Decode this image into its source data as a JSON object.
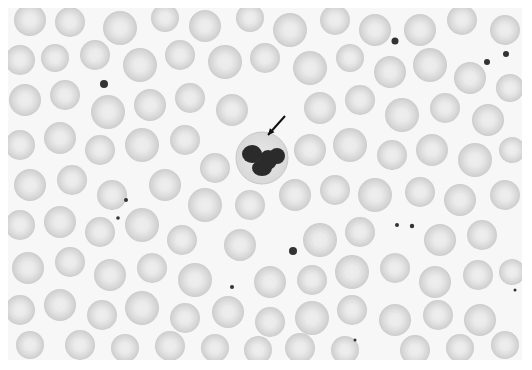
{
  "image": {
    "kind": "blood-smear-micrograph",
    "caption_visible": false,
    "frame": {
      "x": 8,
      "y": 8,
      "width": 514,
      "height": 352
    },
    "colors": {
      "background": "#f7f7f7",
      "rbc_edge": "#bdbdbd",
      "rbc_fill": "#d6d6d6",
      "rbc_center": "#ededed",
      "nucleus": "#2b2b2b",
      "neutrophil_cytoplasm": "#e6e6e6",
      "platelet": "#333333",
      "arrow": "#111111"
    }
  },
  "neutrophil": {
    "cx": 262,
    "cy": 158,
    "r": 26,
    "lobes": [
      {
        "cx": 252,
        "cy": 154,
        "rx": 10,
        "ry": 9
      },
      {
        "cx": 268,
        "cy": 160,
        "rx": 9,
        "ry": 10
      },
      {
        "cx": 262,
        "cy": 168,
        "rx": 10,
        "ry": 8
      },
      {
        "cx": 277,
        "cy": 156,
        "rx": 8,
        "ry": 8
      }
    ]
  },
  "arrow": {
    "x1": 285,
    "y1": 116,
    "x2": 268,
    "y2": 135
  },
  "platelets": [
    {
      "cx": 104,
      "cy": 84,
      "r": 4
    },
    {
      "cx": 395,
      "cy": 41,
      "r": 3.5
    },
    {
      "cx": 487,
      "cy": 62,
      "r": 3
    },
    {
      "cx": 506,
      "cy": 54,
      "r": 3
    },
    {
      "cx": 126,
      "cy": 200,
      "r": 2
    },
    {
      "cx": 118,
      "cy": 218,
      "r": 1.8
    },
    {
      "cx": 293,
      "cy": 251,
      "r": 4
    },
    {
      "cx": 397,
      "cy": 225,
      "r": 2
    },
    {
      "cx": 412,
      "cy": 226,
      "r": 2.2
    },
    {
      "cx": 232,
      "cy": 287,
      "r": 2
    },
    {
      "cx": 515,
      "cy": 290,
      "r": 1.5
    },
    {
      "cx": 355,
      "cy": 340,
      "r": 1.5
    }
  ],
  "rbcs": [
    {
      "cx": 30,
      "cy": 20,
      "r": 16
    },
    {
      "cx": 70,
      "cy": 22,
      "r": 15
    },
    {
      "cx": 120,
      "cy": 28,
      "r": 17
    },
    {
      "cx": 165,
      "cy": 18,
      "r": 14
    },
    {
      "cx": 205,
      "cy": 26,
      "r": 16
    },
    {
      "cx": 250,
      "cy": 18,
      "r": 14
    },
    {
      "cx": 290,
      "cy": 30,
      "r": 17
    },
    {
      "cx": 335,
      "cy": 20,
      "r": 15
    },
    {
      "cx": 375,
      "cy": 30,
      "r": 16
    },
    {
      "cx": 420,
      "cy": 30,
      "r": 16
    },
    {
      "cx": 462,
      "cy": 20,
      "r": 15
    },
    {
      "cx": 505,
      "cy": 30,
      "r": 15
    },
    {
      "cx": 20,
      "cy": 60,
      "r": 15
    },
    {
      "cx": 55,
      "cy": 58,
      "r": 14
    },
    {
      "cx": 95,
      "cy": 55,
      "r": 15
    },
    {
      "cx": 140,
      "cy": 65,
      "r": 17
    },
    {
      "cx": 180,
      "cy": 55,
      "r": 15
    },
    {
      "cx": 225,
      "cy": 62,
      "r": 17
    },
    {
      "cx": 265,
      "cy": 58,
      "r": 15
    },
    {
      "cx": 310,
      "cy": 68,
      "r": 17
    },
    {
      "cx": 350,
      "cy": 58,
      "r": 14
    },
    {
      "cx": 390,
      "cy": 72,
      "r": 16
    },
    {
      "cx": 430,
      "cy": 65,
      "r": 17
    },
    {
      "cx": 470,
      "cy": 78,
      "r": 16
    },
    {
      "cx": 510,
      "cy": 88,
      "r": 14
    },
    {
      "cx": 25,
      "cy": 100,
      "r": 16
    },
    {
      "cx": 65,
      "cy": 95,
      "r": 15
    },
    {
      "cx": 108,
      "cy": 112,
      "r": 17
    },
    {
      "cx": 150,
      "cy": 105,
      "r": 16
    },
    {
      "cx": 190,
      "cy": 98,
      "r": 15
    },
    {
      "cx": 232,
      "cy": 110,
      "r": 16
    },
    {
      "cx": 320,
      "cy": 108,
      "r": 16
    },
    {
      "cx": 360,
      "cy": 100,
      "r": 15
    },
    {
      "cx": 402,
      "cy": 115,
      "r": 17
    },
    {
      "cx": 445,
      "cy": 108,
      "r": 15
    },
    {
      "cx": 488,
      "cy": 120,
      "r": 16
    },
    {
      "cx": 20,
      "cy": 145,
      "r": 15
    },
    {
      "cx": 60,
      "cy": 138,
      "r": 16
    },
    {
      "cx": 100,
      "cy": 150,
      "r": 15
    },
    {
      "cx": 142,
      "cy": 145,
      "r": 17
    },
    {
      "cx": 185,
      "cy": 140,
      "r": 15
    },
    {
      "cx": 215,
      "cy": 168,
      "r": 15
    },
    {
      "cx": 310,
      "cy": 150,
      "r": 16
    },
    {
      "cx": 350,
      "cy": 145,
      "r": 17
    },
    {
      "cx": 392,
      "cy": 155,
      "r": 15
    },
    {
      "cx": 432,
      "cy": 150,
      "r": 16
    },
    {
      "cx": 475,
      "cy": 160,
      "r": 17
    },
    {
      "cx": 512,
      "cy": 150,
      "r": 13
    },
    {
      "cx": 30,
      "cy": 185,
      "r": 16
    },
    {
      "cx": 72,
      "cy": 180,
      "r": 15
    },
    {
      "cx": 112,
      "cy": 195,
      "r": 15
    },
    {
      "cx": 165,
      "cy": 185,
      "r": 16
    },
    {
      "cx": 205,
      "cy": 205,
      "r": 17
    },
    {
      "cx": 250,
      "cy": 205,
      "r": 15
    },
    {
      "cx": 295,
      "cy": 195,
      "r": 16
    },
    {
      "cx": 335,
      "cy": 190,
      "r": 15
    },
    {
      "cx": 375,
      "cy": 195,
      "r": 17
    },
    {
      "cx": 420,
      "cy": 192,
      "r": 15
    },
    {
      "cx": 460,
      "cy": 200,
      "r": 16
    },
    {
      "cx": 505,
      "cy": 195,
      "r": 15
    },
    {
      "cx": 20,
      "cy": 225,
      "r": 15
    },
    {
      "cx": 60,
      "cy": 222,
      "r": 16
    },
    {
      "cx": 100,
      "cy": 232,
      "r": 15
    },
    {
      "cx": 142,
      "cy": 225,
      "r": 17
    },
    {
      "cx": 182,
      "cy": 240,
      "r": 15
    },
    {
      "cx": 240,
      "cy": 245,
      "r": 16
    },
    {
      "cx": 320,
      "cy": 240,
      "r": 17
    },
    {
      "cx": 360,
      "cy": 232,
      "r": 15
    },
    {
      "cx": 440,
      "cy": 240,
      "r": 16
    },
    {
      "cx": 482,
      "cy": 235,
      "r": 15
    },
    {
      "cx": 28,
      "cy": 268,
      "r": 16
    },
    {
      "cx": 70,
      "cy": 262,
      "r": 15
    },
    {
      "cx": 110,
      "cy": 275,
      "r": 16
    },
    {
      "cx": 152,
      "cy": 268,
      "r": 15
    },
    {
      "cx": 195,
      "cy": 280,
      "r": 17
    },
    {
      "cx": 270,
      "cy": 282,
      "r": 16
    },
    {
      "cx": 312,
      "cy": 280,
      "r": 15
    },
    {
      "cx": 352,
      "cy": 272,
      "r": 17
    },
    {
      "cx": 395,
      "cy": 268,
      "r": 15
    },
    {
      "cx": 435,
      "cy": 282,
      "r": 16
    },
    {
      "cx": 478,
      "cy": 275,
      "r": 15
    },
    {
      "cx": 512,
      "cy": 272,
      "r": 13
    },
    {
      "cx": 20,
      "cy": 310,
      "r": 15
    },
    {
      "cx": 60,
      "cy": 305,
      "r": 16
    },
    {
      "cx": 102,
      "cy": 315,
      "r": 15
    },
    {
      "cx": 142,
      "cy": 308,
      "r": 17
    },
    {
      "cx": 185,
      "cy": 318,
      "r": 15
    },
    {
      "cx": 228,
      "cy": 312,
      "r": 16
    },
    {
      "cx": 270,
      "cy": 322,
      "r": 15
    },
    {
      "cx": 312,
      "cy": 318,
      "r": 17
    },
    {
      "cx": 352,
      "cy": 310,
      "r": 15
    },
    {
      "cx": 395,
      "cy": 320,
      "r": 16
    },
    {
      "cx": 438,
      "cy": 315,
      "r": 15
    },
    {
      "cx": 480,
      "cy": 320,
      "r": 16
    },
    {
      "cx": 30,
      "cy": 345,
      "r": 14
    },
    {
      "cx": 80,
      "cy": 345,
      "r": 15
    },
    {
      "cx": 125,
      "cy": 348,
      "r": 14
    },
    {
      "cx": 170,
      "cy": 346,
      "r": 15
    },
    {
      "cx": 215,
      "cy": 348,
      "r": 14
    },
    {
      "cx": 258,
      "cy": 350,
      "r": 14
    },
    {
      "cx": 300,
      "cy": 348,
      "r": 15
    },
    {
      "cx": 345,
      "cy": 350,
      "r": 14
    },
    {
      "cx": 415,
      "cy": 350,
      "r": 15
    },
    {
      "cx": 460,
      "cy": 348,
      "r": 14
    },
    {
      "cx": 505,
      "cy": 345,
      "r": 14
    }
  ]
}
